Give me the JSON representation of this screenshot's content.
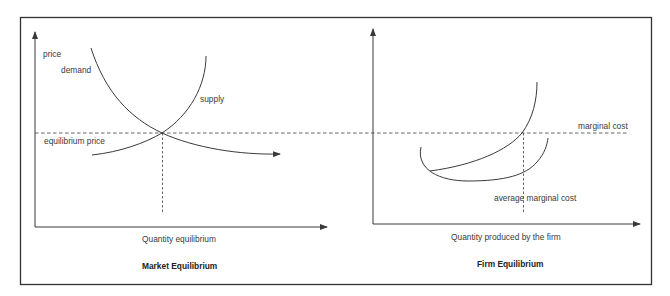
{
  "diagram": {
    "panels": [
      {
        "title": "Market Equilibrium",
        "y_axis_label": "price",
        "x_axis_label": "Quantity equilibrium",
        "curves": [
          {
            "label": "demand",
            "shape": "downward-sloping convex curve with arrowhead"
          },
          {
            "label": "supply",
            "shape": "upward-sloping convex curve"
          }
        ],
        "reference_lines": [
          {
            "label": "equilibrium price",
            "style": "dashed horizontal"
          },
          {
            "label": "",
            "style": "dashed vertical at equilibrium quantity"
          }
        ]
      },
      {
        "title": "Firm Equilibrium",
        "x_axis_label": "Quantity produced by the firm",
        "curves": [
          {
            "label": "average marginal cost",
            "shape": "U-shaped curve"
          },
          {
            "label": "",
            "shape": "rising marginal cost curve"
          }
        ],
        "reference_lines": [
          {
            "label": "marginal cost",
            "style": "dashed horizontal (shared with equilibrium price line)"
          },
          {
            "label": "",
            "style": "dashed vertical at firm quantity"
          }
        ]
      }
    ],
    "labels": {
      "price": "price",
      "demand": "demand",
      "supply": "supply",
      "equilibrium_price": "equilibrium price",
      "quantity_equilibrium": "Quantity equilibrium",
      "market_title": "Market Equilibrium",
      "marginal_cost": "marginal cost",
      "average_marginal_cost": "average marginal cost",
      "quantity_firm": "Quantity produced by the firm",
      "firm_title": "Firm Equilibrium"
    },
    "colors": {
      "line": "#3a3a3a",
      "frame": "#333333",
      "background": "#ffffff"
    }
  }
}
